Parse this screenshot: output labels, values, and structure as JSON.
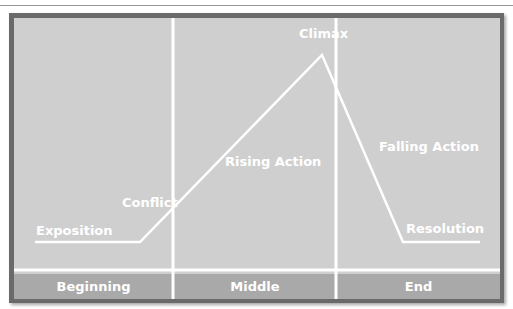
{
  "diagram": {
    "type": "plot-structure (Freytag pyramid)",
    "points": [
      {
        "label": "Exposition"
      },
      {
        "label": "Conflict"
      },
      {
        "label": "Rising Action"
      },
      {
        "label": "Climax"
      },
      {
        "label": "Falling Action"
      },
      {
        "label": "Resolution"
      }
    ],
    "sections": [
      {
        "label": "Beginning"
      },
      {
        "label": "Middle"
      },
      {
        "label": "End"
      }
    ],
    "colors": {
      "background": "#cfcfcf",
      "border": "#6a6a6a",
      "footer": "#a9a9a9",
      "line": "#ffffff"
    }
  }
}
